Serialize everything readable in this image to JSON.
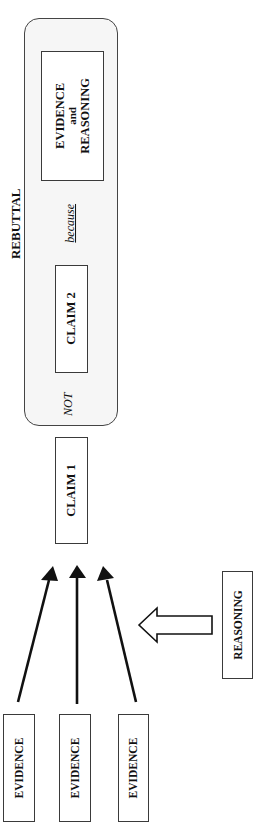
{
  "diagram": {
    "rebuttal": {
      "title": "REBUTTAL",
      "connector_not": "NOT",
      "connector_because": "because",
      "claim2": "CLAIM 2",
      "evidence_reasoning": {
        "line1": "EVIDENCE",
        "line2": "and",
        "line3": "REASONING"
      }
    },
    "claim1": "CLAIM 1",
    "reasoning": "REASONING",
    "evidence": [
      {
        "label": "EVIDENCE"
      },
      {
        "label": "EVIDENCE"
      },
      {
        "label": "EVIDENCE"
      }
    ],
    "arrows": {
      "evidence_to_claim": 3,
      "reasoning_to_evidence_arrows": "hollow-block-arrow"
    },
    "colors": {
      "stroke": "#1a1a1a",
      "panel_fill": "#f6f6f6",
      "background": "#ffffff"
    }
  }
}
